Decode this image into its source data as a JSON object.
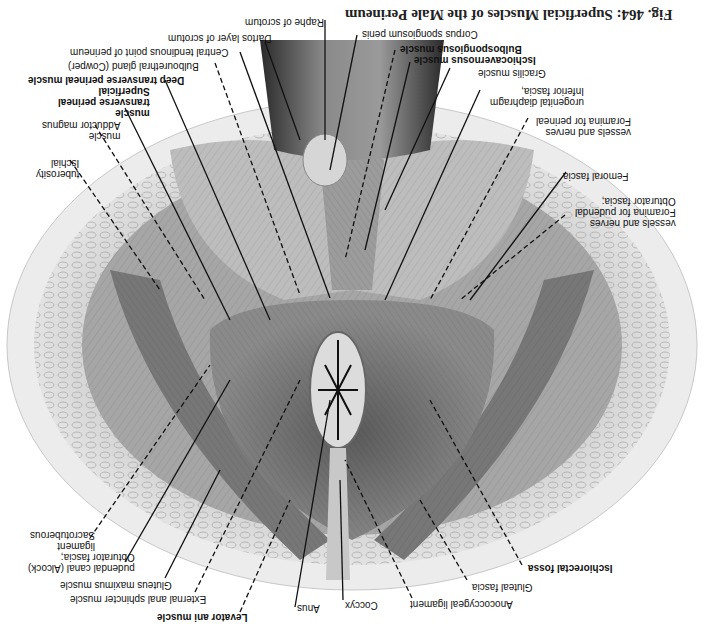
{
  "figure": {
    "title": "Fig. 464: Superficial Muscles of the Male Perineum",
    "orientation": "rotated 180°"
  },
  "labels": {
    "raphe": "Raphe of scrotum",
    "dartos": "Dartos layer of scrotum",
    "corpus": "Corpus spongiosum penis",
    "central": "Central tendinous point of perineum",
    "bulbo_gland": "Bulbourethral gland (Cowper)",
    "bulbospong": "Bulbospongiosus muscle",
    "ischiocav": "Ischiocavernosus muscle",
    "deep_trans": "Deep transverse perineal muscle",
    "gracilis": "Gracilis muscle",
    "superficial_1": "Superficial",
    "superficial_2": "transverse perineal",
    "superficial_3": "muscle",
    "inferior_1": "Inferior fascia,",
    "inferior_2": "urogenital diaphragm",
    "adductor_1": "Adductor magnus",
    "adductor_2": "muscle",
    "foramina_1": "Foramina for perineal",
    "foramina_2": "vessels and nerves",
    "ischial_1": "Ischial",
    "ischial_2": "tuberosity",
    "femoral": "Femoral fascia",
    "obturator_1": "Obturator fascia;",
    "obturator_2": "Foramina for pudendal",
    "obturator_3": "vessels and nerves",
    "sacro_1": "Sacrotuberous",
    "sacro_2": "ligament",
    "alcock_1": "Obturator fascia;",
    "alcock_2": "pudendal canal (Alcock)",
    "gluteus": "Gluteus maximus muscle",
    "ext_anal": "External anal sphincter muscle",
    "levator": "Levator ani muscle",
    "anus": "Anus",
    "coccyx": "Coccyx",
    "anococcygeal": "Anococcygeal ligament",
    "gluteal_fascia": "Gluteal fascia",
    "ischiorectal": "Ischiorectal fossa"
  },
  "colors": {
    "paper": "#ffffff",
    "skin": "#e2e2e2",
    "fat": "#c9c9c9",
    "muscle_light": "#b5b5b5",
    "muscle_dark": "#6e6e6e",
    "shadow": "#3a3a3a",
    "text": "#111111"
  }
}
